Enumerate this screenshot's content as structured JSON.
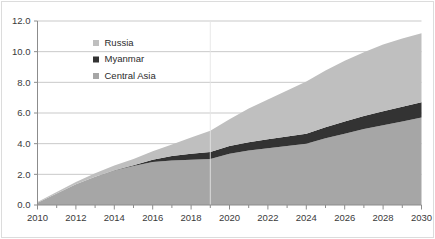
{
  "chart_data": {
    "type": "area",
    "stacked": true,
    "title": "",
    "subtitle": "",
    "xlabel": "",
    "ylabel": "",
    "x": [
      2010,
      2011,
      2012,
      2013,
      2014,
      2015,
      2016,
      2017,
      2018,
      2019,
      2020,
      2021,
      2022,
      2023,
      2024,
      2025,
      2026,
      2027,
      2028,
      2029,
      2030
    ],
    "xlim": [
      2010,
      2030
    ],
    "ylim": [
      0.0,
      12.0
    ],
    "yticks": [
      0.0,
      2.0,
      4.0,
      6.0,
      8.0,
      10.0,
      12.0
    ],
    "ytick_labels": [
      "0.0",
      "2.0",
      "4.0",
      "6.0",
      "8.0",
      "10.0",
      "12.0"
    ],
    "xticks": [
      2010,
      2012,
      2014,
      2016,
      2018,
      2020,
      2022,
      2024,
      2026,
      2028,
      2030
    ],
    "xtick_labels": [
      "2010",
      "2012",
      "2014",
      "2016",
      "2018",
      "2020",
      "2022",
      "2024",
      "2026",
      "2028",
      "2030"
    ],
    "xminor_ticks": [
      2010,
      2011,
      2012,
      2013,
      2014,
      2015,
      2016,
      2017,
      2018,
      2019,
      2020,
      2021,
      2022,
      2023,
      2024,
      2025,
      2026,
      2027,
      2028,
      2029,
      2030
    ],
    "grid": "horizontal",
    "legend_position": "top-left-inset",
    "stack_order_bottom_to_top": [
      "Central Asia",
      "Myanmar",
      "Russia"
    ],
    "series": [
      {
        "name": "Central Asia",
        "color": "#a6a6a6",
        "values": [
          0.15,
          0.75,
          1.35,
          1.85,
          2.25,
          2.55,
          2.8,
          2.9,
          2.95,
          3.0,
          3.35,
          3.55,
          3.7,
          3.85,
          4.0,
          4.35,
          4.65,
          4.95,
          5.2,
          5.45,
          5.7
        ]
      },
      {
        "name": "Myanmar",
        "color": "#333333",
        "values": [
          0.0,
          0.0,
          0.0,
          0.0,
          0.02,
          0.05,
          0.15,
          0.3,
          0.4,
          0.45,
          0.5,
          0.55,
          0.58,
          0.62,
          0.65,
          0.72,
          0.8,
          0.86,
          0.92,
          0.96,
          1.0
        ]
      },
      {
        "name": "Russia",
        "color": "#bfbfbf",
        "values": [
          0.05,
          0.1,
          0.15,
          0.22,
          0.3,
          0.4,
          0.55,
          0.75,
          1.05,
          1.4,
          1.75,
          2.2,
          2.6,
          3.0,
          3.4,
          3.7,
          3.95,
          4.15,
          4.35,
          4.45,
          4.5
        ]
      }
    ],
    "totals": [
      0.2,
      0.85,
      1.5,
      2.07,
      2.57,
      3.0,
      3.5,
      3.95,
      4.4,
      4.85,
      5.6,
      6.3,
      6.88,
      7.47,
      8.05,
      8.77,
      9.4,
      9.96,
      10.47,
      10.86,
      11.2
    ],
    "annotations": [
      {
        "type": "vertical-divider",
        "x": 2019,
        "color": "#e6e6e6"
      }
    ],
    "colors": {
      "russia": "#bfbfbf",
      "myanmar": "#333333",
      "central_asia": "#a6a6a6",
      "gridline": "#c9c9c9",
      "axis": "#8c8c8c",
      "text": "#3a3a3a",
      "background": "#ffffff",
      "border": "#dcdcdc"
    }
  },
  "legend": {
    "items": [
      {
        "label": "Russia",
        "color": "#bfbfbf"
      },
      {
        "label": "Myanmar",
        "color": "#333333"
      },
      {
        "label": "Central Asia",
        "color": "#a6a6a6"
      }
    ]
  }
}
